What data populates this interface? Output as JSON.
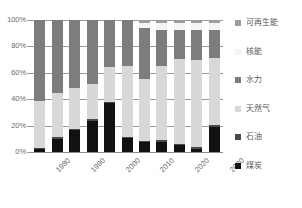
{
  "chart_data": {
    "type": "bar",
    "subtype": "stacked-100-percent",
    "title": "",
    "xlabel": "",
    "ylabel": "",
    "ylim": [
      0,
      100
    ],
    "ytick_labels": [
      "0%",
      "20%",
      "40%",
      "60%",
      "80%",
      "100%"
    ],
    "ytick_values": [
      0,
      20,
      40,
      60,
      80,
      100
    ],
    "grid": true,
    "legend_position": "right",
    "categories": [
      "1980",
      "1985",
      "1990",
      "1995",
      "2000",
      "2005",
      "2010",
      "2015",
      "2020",
      "2025",
      "2030"
    ],
    "xtick_labels": [
      "1980",
      "1990",
      "2000",
      "2010",
      "2020",
      "2030"
    ],
    "xtick_category_index": [
      0,
      2,
      4,
      6,
      8,
      10
    ],
    "series": [
      {
        "name": "煤炭",
        "color": "#111111",
        "values": [
          2,
          10,
          15,
          22,
          31,
          8,
          6,
          6,
          4,
          2,
          16
        ]
      },
      {
        "name": "石油",
        "color": "#4a4a4a",
        "values": [
          1,
          1,
          1,
          1,
          1,
          1,
          1,
          1,
          1,
          1,
          1
        ]
      },
      {
        "name": "天然气",
        "color": "#d8d8d8",
        "values": [
          35,
          33,
          28,
          25,
          22,
          41,
          39,
          45,
          50,
          52,
          42
        ]
      },
      {
        "name": "水力",
        "color": "#7d7d7d",
        "values": [
          61,
          54,
          47,
          45,
          30,
          27,
          32,
          22,
          17,
          18,
          18
        ]
      },
      {
        "name": "核能",
        "color": "#f4f4f4",
        "values": [
          0,
          0,
          0,
          0,
          0,
          0,
          3,
          4,
          4,
          4,
          4
        ]
      },
      {
        "name": "可再生能",
        "color": "#9d9d9d",
        "values": [
          0,
          0,
          0,
          0,
          0,
          0,
          2,
          2,
          2,
          2,
          2
        ]
      }
    ]
  },
  "legend": {
    "items": [
      {
        "label": "可再生能",
        "color": "#9d9d9d"
      },
      {
        "label": "核能",
        "color": "#f4f4f4"
      },
      {
        "label": "水力",
        "color": "#7d7d7d"
      },
      {
        "label": "天然气",
        "color": "#d8d8d8"
      },
      {
        "label": "石油",
        "color": "#4a4a4a"
      },
      {
        "label": "煤炭",
        "color": "#111111"
      }
    ]
  },
  "style": {
    "grid_color": "#9a9a9a",
    "axis_color": "#8c8c8c",
    "tick_text_color": "#6b6b6b",
    "legend_text_color": "#5a5a5a",
    "background": "#ffffff"
  }
}
